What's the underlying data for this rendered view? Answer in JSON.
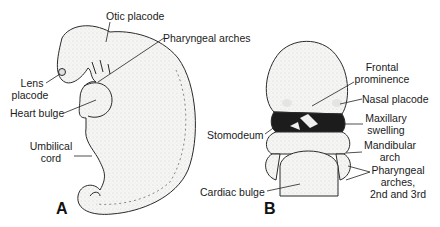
{
  "figure": {
    "panel_a": {
      "letter": "A",
      "labels": {
        "otic_placode": "Otic placode",
        "pharyngeal_arches": "Pharyngeal arches",
        "lens_placode_1": "Lens",
        "lens_placode_2": "placode",
        "heart_bulge": "Heart bulge",
        "umbilical_cord_1": "Umbilical",
        "umbilical_cord_2": "cord"
      }
    },
    "panel_b": {
      "letter": "B",
      "labels": {
        "frontal_prominence_1": "Frontal",
        "frontal_prominence_2": "prominence",
        "nasal_placode": "Nasal placode",
        "stomodeum": "Stomodeum",
        "maxillary_swelling_1": "Maxillary",
        "maxillary_swelling_2": "swelling",
        "mandibular_arch_1": "Mandibular",
        "mandibular_arch_2": "arch",
        "pharyngeal_arches_1": "Pharyngeal",
        "pharyngeal_arches_2": "arches,",
        "pharyngeal_arches_3": "2nd and 3rd",
        "cardiac_bulge": "Cardiac bulge"
      }
    },
    "colors": {
      "outline": "#2a2a2a",
      "fill": "#f4f4f2",
      "stipple": "#bdbdbd",
      "stomodeum_dark": "#1c1c1c",
      "background": "#ffffff"
    }
  }
}
